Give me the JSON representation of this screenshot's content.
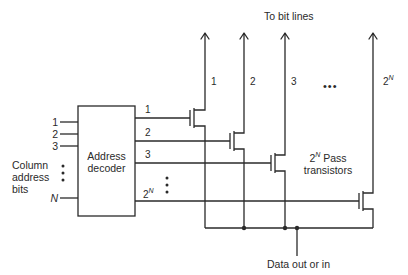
{
  "diagram": {
    "title_top": "To bit lines",
    "decoder": {
      "line1": "Address",
      "line2": "decoder"
    },
    "inputs": [
      {
        "label": "1"
      },
      {
        "label": "2"
      },
      {
        "label": "3"
      },
      {
        "label": "N"
      }
    ],
    "input_group_label": {
      "line1": "Column",
      "line2": "address",
      "line3": "bits"
    },
    "outputs": [
      {
        "label": "1"
      },
      {
        "label": "2"
      },
      {
        "label": "3"
      },
      {
        "base": "2",
        "exp": "N"
      }
    ],
    "bit_lines": [
      {
        "label": "1"
      },
      {
        "label": "2"
      },
      {
        "label": "3"
      },
      {
        "base": "2",
        "exp": "N"
      }
    ],
    "pass_transistors_label": {
      "base": "2",
      "exp": "N",
      "line1_rest": " Pass",
      "line2": "transistors"
    },
    "ellipsis": "•••",
    "bottom_label": "Data out or in"
  }
}
